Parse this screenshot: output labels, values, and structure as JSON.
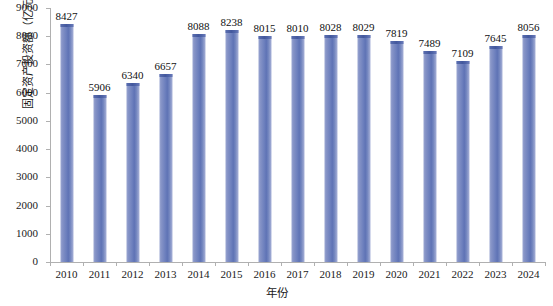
{
  "chart_data": {
    "type": "bar",
    "title": "",
    "xlabel": "年份",
    "ylabel": "固定资产投资额（亿元）",
    "categories": [
      "2010",
      "2011",
      "2012",
      "2013",
      "2014",
      "2015",
      "2016",
      "2017",
      "2018",
      "2019",
      "2020",
      "2021",
      "2022",
      "2023",
      "2024"
    ],
    "values": [
      8427,
      5906,
      6340,
      6657,
      8088,
      8238,
      8015,
      8010,
      8028,
      8029,
      7819,
      7489,
      7109,
      7645,
      8056
    ],
    "series": [
      {
        "name": "固定资产投资额",
        "values": [
          8427,
          5906,
          6340,
          6657,
          8088,
          8238,
          8015,
          8010,
          8028,
          8029,
          7819,
          7489,
          7109,
          7645,
          8056
        ]
      }
    ],
    "ylim": [
      0,
      9000
    ],
    "ytick_labels": [
      "0",
      "1000",
      "2000",
      "3000",
      "4000",
      "5000",
      "6000",
      "7000",
      "8000",
      "9000"
    ],
    "ytick_values": [
      0,
      1000,
      2000,
      3000,
      4000,
      5000,
      6000,
      7000,
      8000,
      9000
    ],
    "grid": false,
    "legend": null,
    "legend_position": "none",
    "data_labels_shown": true,
    "bar_color": "#6b7fc0",
    "bar_cap_color": "#46599f",
    "axis_color": "#b0b0b0",
    "background_color": "#ffffff"
  }
}
